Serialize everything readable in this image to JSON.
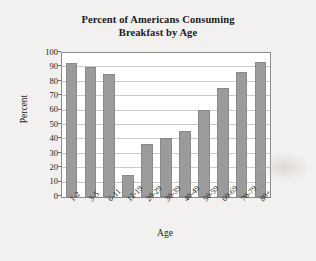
{
  "chart_data": {
    "type": "bar",
    "title": "Percent of Americans Consuming Breakfast by Age",
    "title_line1": "Percent of Americans Consuming",
    "title_line2": "Breakfast by Age",
    "xlabel": "Age",
    "ylabel": "Percent",
    "categories": [
      "1-2",
      "3-5",
      "6-11",
      "12-19",
      "20-29",
      "30-39",
      "40-49",
      "50-59",
      "60-69",
      "70-79",
      "80+"
    ],
    "values": [
      93,
      90,
      85.5,
      15,
      36.5,
      41,
      46,
      60.5,
      75.5,
      87,
      94
    ],
    "ylim": [
      0,
      100
    ],
    "y_ticks": [
      0,
      10,
      20,
      30,
      40,
      50,
      60,
      70,
      80,
      90,
      100
    ],
    "y_tick_labels": [
      "0",
      "10",
      "20",
      "30",
      "40",
      "50",
      "60",
      "70",
      "80",
      "90",
      "100"
    ],
    "grid": true,
    "grid_axis": "y",
    "legend": false,
    "bar_color": "#9b9b9b",
    "bar_edge_color": "#8a8a8a",
    "plot_background": "#ffffff",
    "figure_background": "#f2f1ef",
    "axis_color": "#8c8c8c",
    "gridline_color": "#c9c9c9",
    "text_color": "#1b1b1b"
  }
}
